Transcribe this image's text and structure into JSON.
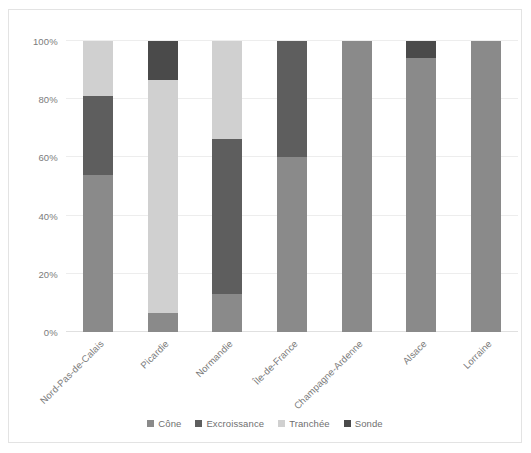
{
  "chart_data": {
    "type": "bar",
    "subtype": "100% stacked column",
    "title": "",
    "xlabel": "",
    "ylabel": "",
    "ylim": [
      0,
      100
    ],
    "ytick_labels": [
      "0%",
      "20%",
      "40%",
      "60%",
      "80%",
      "100%"
    ],
    "ytick_values": [
      0,
      20,
      40,
      60,
      80,
      100
    ],
    "grid": true,
    "grid_axis": "y",
    "legend_position": "bottom",
    "categories": [
      "Nord-Pas-de-Calais",
      "Picardie",
      "Normandie",
      "Île-de-France",
      "Champagne-Ardenne",
      "Alsace",
      "Lorraine"
    ],
    "series": [
      {
        "name": "Cône",
        "color": "#8a8a8a",
        "values": [
          54,
          6.5,
          13,
          60,
          100,
          94,
          100
        ]
      },
      {
        "name": "Excroissance",
        "color": "#5e5e5e",
        "values": [
          27,
          0,
          53.5,
          40,
          0,
          0,
          0
        ]
      },
      {
        "name": "Tranchée",
        "color": "#d0d0d0",
        "values": [
          19,
          80,
          33.5,
          0,
          0,
          0,
          0
        ]
      },
      {
        "name": "Sonde",
        "color": "#4a4a4a",
        "values": [
          0,
          13.5,
          0,
          0,
          0,
          6,
          0
        ]
      }
    ]
  },
  "colors": {
    "cone": "#8a8a8a",
    "excroissance": "#5e5e5e",
    "tranchee": "#d0d0d0",
    "sonde": "#4a4a4a",
    "gridline": "#ededed",
    "axis_text": "#7b7b7b",
    "frame_border": "#e3e3e3",
    "background": "#ffffff"
  }
}
